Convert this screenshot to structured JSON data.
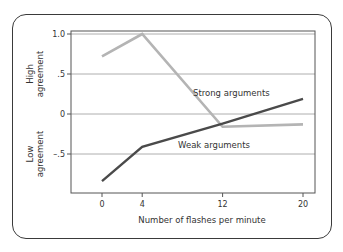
{
  "chart_data": {
    "type": "line",
    "title": "",
    "xlabel": "Number of flashes per minute",
    "ylabel": "",
    "ylabel_high": [
      "High",
      "agreement"
    ],
    "ylabel_low": [
      "Low",
      "agreement"
    ],
    "x": [
      0,
      4,
      12,
      20
    ],
    "x_tick_labels": [
      "0",
      "4",
      "12",
      "20"
    ],
    "y_tick_labels": [
      "1.0",
      ".5",
      "0",
      "–.5"
    ],
    "y_ticks": [
      1.0,
      0.5,
      0,
      -0.5
    ],
    "ylim": [
      -0.98,
      1.04
    ],
    "grid": true,
    "legend": "inline labels",
    "series": [
      {
        "name": "Strong arguments",
        "values": [
          0.72,
          1.0,
          -0.16,
          -0.13
        ],
        "color": "#b4b4b4"
      },
      {
        "name": "Weak arguments",
        "values": [
          -0.84,
          -0.41,
          -0.12,
          0.19
        ],
        "color": "#4a4a4a"
      }
    ]
  },
  "colors": {
    "frame": "#3a3a3a",
    "axis": "#555555",
    "grid": "#9a9a9a",
    "strong": "#b4b4b4",
    "weak": "#4a4a4a"
  }
}
